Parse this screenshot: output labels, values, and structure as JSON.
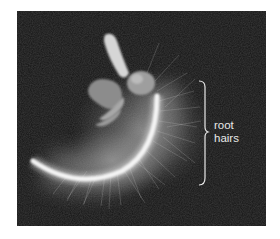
{
  "figure": {
    "background_color": "#141414",
    "annotation": {
      "line1": "root",
      "line2": "hairs",
      "color": "#e8e8e8",
      "bracket_icon": "right-curly-brace"
    }
  }
}
